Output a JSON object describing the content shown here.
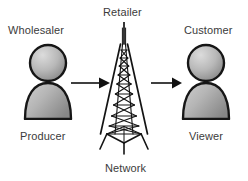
{
  "diagram": {
    "background_color": "#ffffff",
    "text_color": "#3b3b3b",
    "labels": {
      "top_left": "Wholesaler",
      "top_center": "Retailer",
      "top_right": "Customer",
      "bottom_left": "Producer",
      "bottom_center": "Network",
      "bottom_right": "Viewer"
    },
    "nodes": [
      {
        "id": "producer",
        "icon": "person-icon",
        "top_label": "Wholesaler",
        "bottom_label": "Producer",
        "fill_light": "#d2d2d2",
        "fill_dark": "#8c8c8c",
        "outline": "#1a1a1a"
      },
      {
        "id": "network",
        "icon": "radio-tower-icon",
        "top_label": "Retailer",
        "bottom_label": "Network",
        "outline": "#1a1a1a"
      },
      {
        "id": "viewer",
        "icon": "person-icon",
        "top_label": "Customer",
        "bottom_label": "Viewer",
        "fill_light": "#d2d2d2",
        "fill_dark": "#8c8c8c",
        "outline": "#1a1a1a"
      }
    ],
    "arrows": [
      {
        "id": "producer-to-network",
        "direction": "right",
        "color": "#111111"
      },
      {
        "id": "network-to-viewer",
        "direction": "right",
        "color": "#111111"
      }
    ]
  }
}
